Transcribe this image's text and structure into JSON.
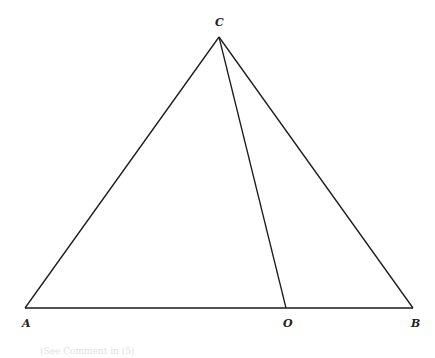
{
  "diagram": {
    "type": "geometry-triangle",
    "points": {
      "A": {
        "label": "A",
        "x": 25,
        "y": 308,
        "label_x": 22,
        "label_y": 327
      },
      "B": {
        "label": "B",
        "x": 413,
        "y": 308,
        "label_x": 411,
        "label_y": 327
      },
      "C": {
        "label": "C",
        "x": 219,
        "y": 37,
        "label_x": 215,
        "label_y": 26
      },
      "O": {
        "label": "O",
        "x": 286,
        "y": 308,
        "label_x": 283,
        "label_y": 327
      }
    },
    "segments": [
      {
        "name": "AC",
        "from": "A",
        "to": "C"
      },
      {
        "name": "CB",
        "from": "C",
        "to": "B"
      },
      {
        "name": "AB",
        "from": "A",
        "to": "B"
      },
      {
        "name": "CO",
        "from": "C",
        "to": "O"
      }
    ],
    "caption": "(See Comment in (5)",
    "line_color": "#1a1a1a"
  }
}
